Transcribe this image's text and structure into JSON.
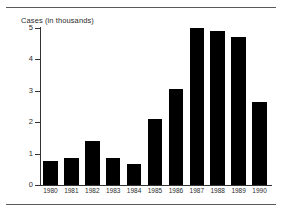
{
  "chart_data": {
    "type": "bar",
    "title": "Cases (in thousands)",
    "xlabel": "",
    "ylabel": "Cases (in thousands)",
    "categories": [
      "1980",
      "1981",
      "1982",
      "1983",
      "1984",
      "1985",
      "1986",
      "1987",
      "1988",
      "1989",
      "1990"
    ],
    "values": [
      0.78,
      0.85,
      1.4,
      0.87,
      0.68,
      2.1,
      3.05,
      5.0,
      4.9,
      4.7,
      2.65
    ],
    "ylim": [
      0,
      5
    ],
    "yticks": [
      0,
      1,
      2,
      3,
      4,
      5
    ],
    "ytick_labels": [
      "0",
      "1",
      "2",
      "3",
      "4",
      "5"
    ],
    "grid": false,
    "legend": null,
    "bar_color": "#000000"
  },
  "figure": {
    "axis_title": "Cases (in thousands)",
    "rule_color": "#5a5a5a",
    "axis_color": "#333333"
  }
}
